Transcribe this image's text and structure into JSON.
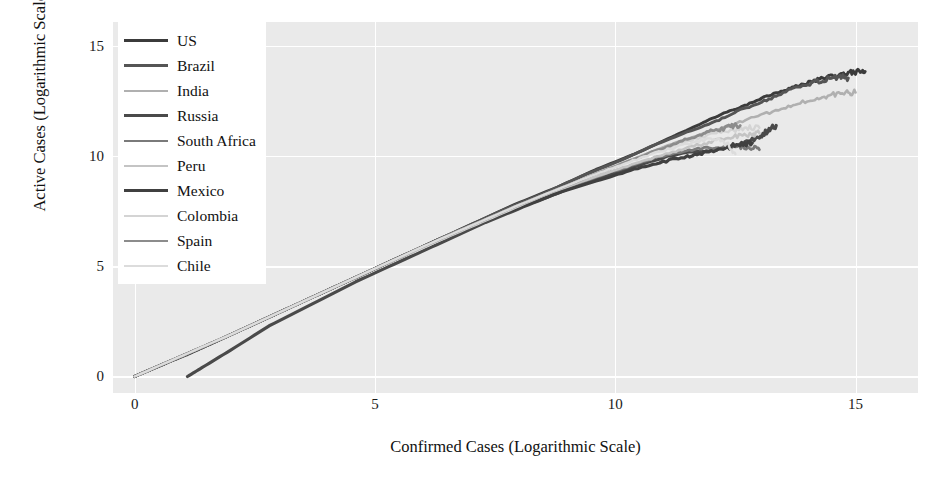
{
  "chart_data": {
    "type": "line",
    "title": "",
    "xlabel": "Confirmed Cases (Logarithmic Scale)",
    "ylabel": "Active Cases (Logarithmic Scale)",
    "xlim": [
      -0.45,
      16.3
    ],
    "ylim": [
      -0.75,
      16.1
    ],
    "xticks": [
      "0",
      "5",
      "10",
      "15"
    ],
    "xtick_values": [
      0,
      5,
      10,
      15
    ],
    "yticks": [
      "0",
      "5",
      "10",
      "15"
    ],
    "ytick_values": [
      0,
      5,
      10,
      15
    ],
    "grid": true,
    "legend_position": "upper left",
    "series": [
      {
        "name": "US",
        "color": "#3b3b3b",
        "x": [
          0.0,
          0.7,
          1.1,
          1.6,
          2.2,
          2.9,
          3.6,
          4.4,
          5.2,
          6.1,
          7.0,
          7.9,
          8.8,
          9.6,
          10.4,
          11.1,
          11.7,
          12.2,
          12.7,
          13.1,
          13.5,
          13.8,
          14.1,
          14.4,
          14.7,
          14.9,
          15.1,
          15.2
        ],
        "y": [
          0.0,
          0.65,
          1.0,
          1.5,
          2.1,
          2.8,
          3.5,
          4.3,
          5.1,
          6.0,
          6.9,
          7.8,
          8.6,
          9.4,
          10.1,
          10.8,
          11.4,
          11.9,
          12.3,
          12.7,
          13.0,
          13.2,
          13.4,
          13.6,
          13.7,
          13.8,
          13.85,
          13.85
        ]
      },
      {
        "name": "Brazil",
        "color": "#555555",
        "x": [
          0.0,
          0.8,
          1.5,
          2.3,
          3.1,
          4.0,
          4.9,
          5.8,
          6.7,
          7.6,
          8.5,
          9.3,
          10.1,
          10.8,
          11.5,
          12.1,
          12.6,
          13.1,
          13.5,
          13.9,
          14.2,
          14.5,
          14.7,
          14.85
        ],
        "y": [
          0.0,
          0.75,
          1.4,
          2.2,
          3.0,
          3.9,
          4.8,
          5.7,
          6.6,
          7.5,
          8.3,
          9.1,
          9.8,
          10.5,
          11.1,
          11.6,
          12.1,
          12.5,
          12.9,
          13.2,
          13.4,
          13.55,
          13.6,
          13.55
        ]
      },
      {
        "name": "India",
        "color": "#b0b0b0",
        "x": [
          0.0,
          0.9,
          1.7,
          2.5,
          3.4,
          4.3,
          5.2,
          6.1,
          7.0,
          7.9,
          8.8,
          9.6,
          10.4,
          11.1,
          11.8,
          12.4,
          12.9,
          13.4,
          13.8,
          14.2,
          14.5,
          14.8,
          15.0
        ],
        "y": [
          0.0,
          0.85,
          1.6,
          2.4,
          3.3,
          4.2,
          5.1,
          6.0,
          6.85,
          7.7,
          8.5,
          9.2,
          9.9,
          10.5,
          11.0,
          11.4,
          11.8,
          12.1,
          12.4,
          12.6,
          12.8,
          12.9,
          12.9
        ]
      },
      {
        "name": "Russia",
        "color": "#4a4a4a",
        "x": [
          1.1,
          1.4,
          2.0,
          2.8,
          3.7,
          4.6,
          5.5,
          6.4,
          7.3,
          8.2,
          9.0,
          9.8,
          10.5,
          11.1,
          11.6,
          12.0,
          12.4,
          12.7,
          13.0,
          13.2,
          13.35
        ],
        "y": [
          0.0,
          0.4,
          1.2,
          2.3,
          3.3,
          4.3,
          5.2,
          6.1,
          7.0,
          7.8,
          8.5,
          9.1,
          9.6,
          10.0,
          10.2,
          10.25,
          10.4,
          10.6,
          10.9,
          11.2,
          11.4
        ]
      },
      {
        "name": "South Africa",
        "color": "#7a7a7a",
        "x": [
          0.0,
          1.0,
          1.9,
          2.8,
          3.7,
          4.6,
          5.5,
          6.4,
          7.3,
          8.2,
          9.0,
          9.8,
          10.5,
          11.1,
          11.6,
          12.1,
          12.5,
          12.8,
          13.0
        ],
        "y": [
          0.0,
          0.95,
          1.8,
          2.7,
          3.6,
          4.5,
          5.4,
          6.3,
          7.1,
          7.9,
          8.6,
          9.2,
          9.7,
          10.1,
          10.3,
          10.4,
          10.45,
          10.4,
          10.3
        ]
      },
      {
        "name": "Peru",
        "color": "#c4c4c4",
        "x": [
          0.0,
          1.0,
          1.9,
          2.8,
          3.8,
          4.7,
          5.6,
          6.5,
          7.4,
          8.3,
          9.1,
          9.9,
          10.6,
          11.2,
          11.7,
          12.1,
          12.5,
          12.8,
          13.0
        ],
        "y": [
          0.0,
          0.95,
          1.8,
          2.7,
          3.7,
          4.6,
          5.5,
          6.4,
          7.2,
          8.0,
          8.7,
          9.3,
          9.8,
          10.2,
          10.5,
          10.7,
          10.9,
          11.0,
          11.05
        ]
      },
      {
        "name": "Mexico",
        "color": "#404040",
        "x": [
          0.0,
          0.9,
          1.8,
          2.7,
          3.6,
          4.5,
          5.4,
          6.3,
          7.2,
          8.1,
          8.9,
          9.7,
          10.4,
          11.0,
          11.5,
          11.9,
          12.3,
          12.6,
          12.85
        ],
        "y": [
          0.0,
          0.85,
          1.7,
          2.6,
          3.5,
          4.4,
          5.3,
          6.2,
          7.0,
          7.75,
          8.4,
          8.95,
          9.4,
          9.75,
          10.0,
          10.2,
          10.4,
          10.55,
          10.6
        ]
      },
      {
        "name": "Colombia",
        "color": "#d4d4d4",
        "x": [
          0.0,
          1.0,
          2.0,
          3.0,
          4.0,
          5.0,
          6.0,
          6.9,
          7.8,
          8.7,
          9.5,
          10.3,
          11.0,
          11.6,
          12.1,
          12.5,
          12.8,
          13.0
        ],
        "y": [
          0.0,
          0.95,
          1.9,
          2.9,
          3.9,
          4.9,
          5.85,
          6.7,
          7.55,
          8.4,
          9.1,
          9.8,
          10.3,
          10.75,
          11.05,
          11.2,
          11.3,
          11.3
        ]
      },
      {
        "name": "Spain",
        "color": "#8c8c8c",
        "x": [
          0.0,
          1.0,
          2.0,
          3.0,
          4.0,
          5.0,
          6.0,
          7.0,
          7.9,
          8.8,
          9.6,
          10.3,
          10.9,
          11.4,
          11.8,
          12.1,
          12.4,
          12.6
        ],
        "y": [
          0.0,
          0.95,
          1.9,
          2.9,
          3.9,
          4.9,
          5.9,
          6.85,
          7.7,
          8.5,
          9.2,
          9.8,
          10.3,
          10.7,
          11.0,
          11.2,
          11.35,
          11.4
        ]
      },
      {
        "name": "Chile",
        "color": "#dcdcdc",
        "x": [
          0.0,
          1.0,
          2.0,
          3.0,
          4.0,
          5.0,
          6.0,
          7.0,
          7.9,
          8.8,
          9.6,
          10.3,
          10.9,
          11.4,
          11.8,
          12.1,
          12.35,
          12.5
        ],
        "y": [
          0.0,
          0.95,
          1.9,
          2.9,
          3.9,
          4.9,
          5.9,
          6.85,
          7.7,
          8.5,
          9.2,
          9.75,
          10.2,
          10.5,
          10.7,
          10.8,
          10.5,
          10.1
        ]
      }
    ]
  },
  "axes": {
    "xlabel": "Confirmed Cases (Logarithmic Scale)",
    "ylabel": "Active Cases (Logarithmic Scale)",
    "xticks": [
      "0",
      "5",
      "10",
      "15"
    ],
    "yticks": [
      "0",
      "5",
      "10",
      "15"
    ]
  },
  "legend": {
    "items": [
      {
        "label": "US",
        "color": "#3b3b3b",
        "width": 3.0
      },
      {
        "label": "Brazil",
        "color": "#555555",
        "width": 3.0
      },
      {
        "label": "India",
        "color": "#b0b0b0",
        "width": 2.6
      },
      {
        "label": "Russia",
        "color": "#4a4a4a",
        "width": 3.2
      },
      {
        "label": "South Africa",
        "color": "#7a7a7a",
        "width": 2.8
      },
      {
        "label": "Peru",
        "color": "#c4c4c4",
        "width": 2.6
      },
      {
        "label": "Mexico",
        "color": "#404040",
        "width": 3.2
      },
      {
        "label": "Colombia",
        "color": "#d4d4d4",
        "width": 2.4
      },
      {
        "label": "Spain",
        "color": "#8c8c8c",
        "width": 2.8
      },
      {
        "label": "Chile",
        "color": "#dcdcdc",
        "width": 2.4
      }
    ]
  },
  "style": {
    "panel_background": "#eaeaea",
    "grid_color": "#ffffff",
    "figure_background": "#ffffff",
    "text_color": "#111111"
  }
}
